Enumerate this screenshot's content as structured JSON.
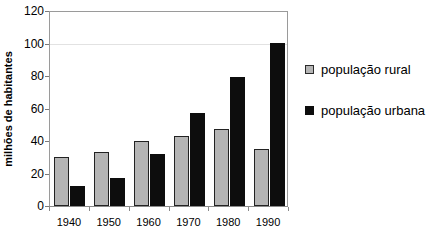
{
  "chart_data": {
    "type": "bar",
    "title": "",
    "xlabel": "",
    "ylabel": "milhões de habitantes",
    "categories": [
      "1940",
      "1950",
      "1960",
      "1970",
      "1980",
      "1990"
    ],
    "series": [
      {
        "name": "população rural",
        "color": "#b5b5b5",
        "values": [
          30,
          33,
          40,
          43,
          47,
          35
        ]
      },
      {
        "name": "população urbana",
        "color": "#0d0d0d",
        "values": [
          12,
          17,
          32,
          57,
          79,
          100
        ]
      }
    ],
    "ylim": [
      0,
      120
    ],
    "ytick_labels": [
      "0",
      "20",
      "40",
      "60",
      "80",
      "100",
      "120"
    ],
    "ytick_values": [
      0,
      20,
      40,
      60,
      80,
      100,
      120
    ],
    "grid": "horizontal gridline at 100 only",
    "gridline_values": [
      100
    ],
    "legend_position": "right"
  },
  "legend": {
    "entries": [
      {
        "label": "população rural",
        "swatch": "gray-square-swatch"
      },
      {
        "label": "população urbana",
        "swatch": "black-square-swatch"
      }
    ]
  }
}
